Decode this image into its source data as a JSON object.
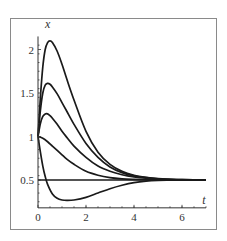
{
  "chart_data": {
    "type": "line",
    "title": "",
    "xlabel": "t",
    "ylabel": "x",
    "xlim": [
      0,
      7
    ],
    "ylim": [
      0.18,
      2.15
    ],
    "grid": false,
    "legend": null,
    "x_ticks": [
      0,
      2,
      4,
      6
    ],
    "x_tick_labels": [
      "0",
      "2",
      "4",
      "6"
    ],
    "y_ticks": [
      0.5,
      1,
      1.5,
      2
    ],
    "y_tick_labels": [
      "0.5",
      "1",
      "1.5",
      "2"
    ],
    "series": [
      {
        "name": "curve-1",
        "x": [
          0,
          0.1,
          0.2,
          0.3,
          0.4,
          0.5,
          0.6,
          0.8,
          1.0,
          1.2,
          1.5,
          2.0,
          2.5,
          3.0,
          3.5,
          4.0,
          4.5,
          5.0,
          5.5,
          6.0,
          7.0
        ],
        "values": [
          1.0,
          1.45,
          1.8,
          2.0,
          2.08,
          2.1,
          2.08,
          1.98,
          1.83,
          1.66,
          1.42,
          1.06,
          0.82,
          0.68,
          0.6,
          0.555,
          0.53,
          0.515,
          0.508,
          0.504,
          0.5
        ]
      },
      {
        "name": "curve-2",
        "x": [
          0,
          0.1,
          0.2,
          0.3,
          0.4,
          0.5,
          0.6,
          0.8,
          1.0,
          1.2,
          1.5,
          2.0,
          2.5,
          3.0,
          3.5,
          4.0,
          4.5,
          5.0,
          5.5,
          6.0,
          7.0
        ],
        "values": [
          1.0,
          1.3,
          1.5,
          1.59,
          1.61,
          1.6,
          1.57,
          1.49,
          1.39,
          1.29,
          1.14,
          0.92,
          0.76,
          0.65,
          0.585,
          0.548,
          0.527,
          0.514,
          0.507,
          0.504,
          0.5
        ]
      },
      {
        "name": "curve-3",
        "x": [
          0,
          0.1,
          0.2,
          0.3,
          0.4,
          0.5,
          0.6,
          0.8,
          1.0,
          1.2,
          1.5,
          2.0,
          2.5,
          3.0,
          3.5,
          4.0,
          4.5,
          5.0,
          5.5,
          6.0,
          7.0
        ],
        "values": [
          1.0,
          1.15,
          1.23,
          1.26,
          1.26,
          1.24,
          1.21,
          1.14,
          1.06,
          0.99,
          0.89,
          0.76,
          0.66,
          0.6,
          0.56,
          0.535,
          0.52,
          0.511,
          0.506,
          0.503,
          0.5
        ]
      },
      {
        "name": "curve-4",
        "x": [
          0,
          0.2,
          0.4,
          0.6,
          0.8,
          1.0,
          1.2,
          1.5,
          2.0,
          2.5,
          3.0,
          3.5,
          4.0,
          4.5,
          5.0,
          5.5,
          6.0,
          7.0
        ],
        "values": [
          1.0,
          0.98,
          0.94,
          0.89,
          0.84,
          0.79,
          0.74,
          0.68,
          0.6,
          0.555,
          0.528,
          0.514,
          0.507,
          0.503,
          0.502,
          0.501,
          0.5,
          0.5
        ]
      },
      {
        "name": "curve-5",
        "x": [
          0,
          0.1,
          0.2,
          0.3,
          0.4,
          0.6,
          0.8,
          1.0,
          1.2,
          1.5,
          2.0,
          2.5,
          3.0,
          3.5,
          4.0,
          4.5,
          5.0,
          5.5,
          6.0,
          7.0
        ],
        "values": [
          1.0,
          0.82,
          0.66,
          0.54,
          0.45,
          0.34,
          0.29,
          0.27,
          0.265,
          0.27,
          0.3,
          0.35,
          0.4,
          0.44,
          0.47,
          0.487,
          0.495,
          0.498,
          0.5,
          0.5
        ]
      },
      {
        "name": "equilibrium",
        "x": [
          0,
          7.0
        ],
        "values": [
          0.5,
          0.5
        ]
      }
    ]
  }
}
